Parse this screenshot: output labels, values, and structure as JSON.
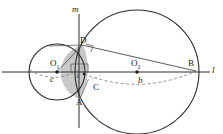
{
  "figure": {
    "type": "geometry-diagram",
    "canvas": {
      "width": 223,
      "height": 134,
      "background": "#ffffff"
    }
  },
  "colors": {
    "stroke": "#2b2b2b",
    "thin_stroke": "#555555",
    "dashed": "#777777",
    "shaded_lens": "#8a8a8a",
    "label": "#1a1a1a"
  },
  "lines": [
    {
      "name": "line-l",
      "label": "l",
      "orientation": "horizontal",
      "y": 72
    },
    {
      "name": "line-m",
      "label": "m",
      "orientation": "vertical",
      "x": 79
    },
    {
      "name": "segment-DB",
      "from": "D",
      "to": "B"
    },
    {
      "name": "segment-DO1",
      "from": "D",
      "to": "O1"
    }
  ],
  "circles": [
    {
      "name": "circle-small",
      "center_label": "O1",
      "cx": 57,
      "cy": 72,
      "r": 28,
      "arc_label": "c"
    },
    {
      "name": "circle-large",
      "center_label": "O2",
      "cx": 137,
      "cy": 72,
      "r": 62,
      "arc_label": "b"
    }
  ],
  "points": [
    {
      "name": "point-O1",
      "label": "O",
      "subscript": "1",
      "x": 57,
      "y": 72
    },
    {
      "name": "point-O2",
      "label": "O",
      "subscript": "2",
      "x": 137,
      "y": 72
    },
    {
      "name": "point-D",
      "label": "D",
      "x": 83,
      "y": 45
    },
    {
      "name": "point-A",
      "label": "A",
      "x": 80,
      "y": 99
    },
    {
      "name": "point-C",
      "label": "C",
      "x": 88,
      "y": 82
    },
    {
      "name": "point-B",
      "label": "B",
      "x": 195,
      "y": 72
    }
  ],
  "labels": {
    "line_l": "l",
    "line_m": "m",
    "center_1": "O",
    "center_1_sub": "1",
    "center_2": "O",
    "center_2_sub": "2",
    "point_D": "D",
    "point_A": "A",
    "point_C": "C",
    "point_B": "B",
    "arc_c": "c",
    "arc_b": "b",
    "segment_1": "1"
  },
  "markers": [
    {
      "name": "right-angle-marker-left",
      "x": 70,
      "y": 63,
      "size": 8
    },
    {
      "name": "right-angle-marker-right",
      "x": 80,
      "y": 62,
      "size": 8
    },
    {
      "name": "right-angle-marker-upper",
      "x": 88,
      "y": 48,
      "size": 7
    }
  ],
  "dashed_arcs": [
    {
      "name": "dashed-arc-c",
      "label": "c",
      "belongs_to": "circle-small"
    },
    {
      "name": "dashed-arc-b",
      "label": "b",
      "belongs_to": "circle-large"
    }
  ]
}
